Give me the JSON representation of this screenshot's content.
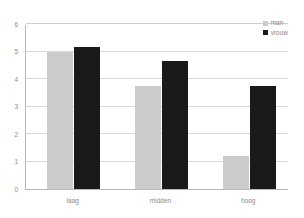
{
  "chart_data": {
    "type": "bar",
    "title": "",
    "subtitle": "",
    "xlabel": "",
    "ylabel": "",
    "categories": [
      "laag",
      "midden",
      "hoog"
    ],
    "series": [
      {
        "name": "man",
        "color": "#cccccc",
        "values": [
          5.0,
          3.75,
          1.2
        ]
      },
      {
        "name": "vrouw",
        "color": "#1a1a1a",
        "values": [
          5.15,
          4.65,
          3.75
        ]
      }
    ],
    "ylim": [
      0,
      6
    ],
    "yticks": [
      0,
      1,
      2,
      3,
      4,
      5,
      6
    ],
    "ytick_labels": [
      "0",
      "1",
      "2",
      "3",
      "4",
      "5",
      "6"
    ],
    "grid": true,
    "grid_axis": "y",
    "legend_position": "top-right",
    "annotations": []
  },
  "style": {
    "background": "#ffffff",
    "axis_color": "#b8b8b8",
    "gridline_color": "#d9d9d9",
    "text_color": "#8a8a8a"
  }
}
